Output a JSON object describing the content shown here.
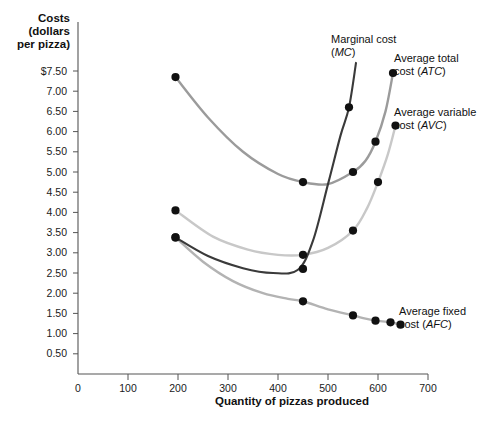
{
  "chart_data": {
    "type": "line",
    "title": "",
    "ylabel": "Costs (dollars per pizza)",
    "ylabel_lines": [
      "Costs",
      "(dollars",
      "per pizza)"
    ],
    "xlabel": "Quantity of pizzas produced",
    "xlim": [
      0,
      700
    ],
    "ylim": [
      0,
      7.75
    ],
    "grid": false,
    "legend_position": "inline-annotations",
    "x_ticks": [
      0,
      100,
      200,
      300,
      400,
      500,
      600,
      700
    ],
    "x_tick_labels": [
      "0",
      "100",
      "200",
      "300",
      "400",
      "500",
      "600",
      "700"
    ],
    "y_ticks": [
      0.5,
      1.0,
      1.5,
      2.0,
      2.5,
      3.0,
      3.5,
      4.0,
      4.5,
      5.0,
      5.5,
      6.0,
      6.5,
      7.0,
      7.5
    ],
    "y_tick_labels": [
      "0.50",
      "1.00",
      "1.50",
      "2.00",
      "2.50",
      "3.00",
      "3.50",
      "4.00",
      "4.50",
      "5.00",
      "5.50",
      "6.00",
      "6.50",
      "7.00",
      "$7.50"
    ],
    "series": [
      {
        "name": "Marginal cost (MC)",
        "abbr": "MC",
        "color": "#3a3a3a",
        "label_line1": "Marginal cost",
        "label_line2": "(MC)",
        "points": [
          {
            "x": 195,
            "y": 3.38
          },
          {
            "x": 450,
            "y": 2.6
          },
          {
            "x": 542,
            "y": 6.6
          }
        ]
      },
      {
        "name": "Average total cost (ATC)",
        "abbr": "ATC",
        "color": "#9b9b9b",
        "label_line1": "Average total",
        "label_line2": "cost (ATC)",
        "points": [
          {
            "x": 195,
            "y": 7.35
          },
          {
            "x": 450,
            "y": 4.75
          },
          {
            "x": 550,
            "y": 5.0
          },
          {
            "x": 595,
            "y": 5.75
          },
          {
            "x": 630,
            "y": 7.45
          }
        ]
      },
      {
        "name": "Average variable cost (AVC)",
        "abbr": "AVC",
        "color": "#c8c8c8",
        "label_line1": "Average variable",
        "label_line2": "cost (AVC)",
        "points": [
          {
            "x": 195,
            "y": 4.05
          },
          {
            "x": 450,
            "y": 2.95
          },
          {
            "x": 550,
            "y": 3.55
          },
          {
            "x": 600,
            "y": 4.75
          },
          {
            "x": 635,
            "y": 6.15
          }
        ]
      },
      {
        "name": "Average fixed cost (AFC)",
        "abbr": "AFC",
        "color": "#b3b3b3",
        "label_line1": "Average fixed",
        "label_line2": "cost (AFC)",
        "points": [
          {
            "x": 195,
            "y": 3.38
          },
          {
            "x": 450,
            "y": 1.8
          },
          {
            "x": 550,
            "y": 1.45
          },
          {
            "x": 595,
            "y": 1.32
          },
          {
            "x": 625,
            "y": 1.28
          },
          {
            "x": 645,
            "y": 1.22
          }
        ]
      }
    ]
  },
  "annotations": {
    "mc": {
      "line1": "Marginal cost",
      "line2_prefix": "(",
      "line2_italic": "MC",
      "line2_suffix": ")"
    },
    "atc": {
      "line1": "Average total",
      "line2_prefix": "cost (",
      "line2_italic": "ATC",
      "line2_suffix": ")"
    },
    "avc": {
      "line1": "Average variable",
      "line2_prefix": "cost (",
      "line2_italic": "AVC",
      "line2_suffix": ")"
    },
    "afc": {
      "line1": "Average fixed",
      "line2_prefix": "cost (",
      "line2_italic": "AFC",
      "line2_suffix": ")"
    }
  }
}
